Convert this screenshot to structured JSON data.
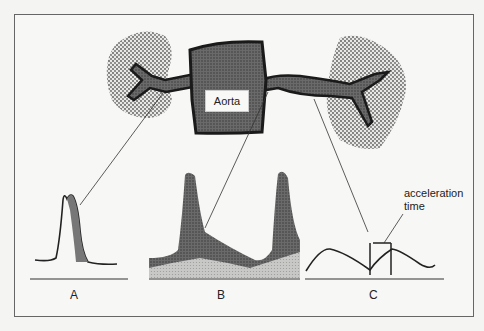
{
  "diagram": {
    "nodes": {
      "aorta": "Aorta",
      "left_kidney": "left kidney",
      "right_kidney": "right kidney"
    },
    "waveforms": [
      {
        "id": "A",
        "label": "A"
      },
      {
        "id": "B",
        "label": "B"
      },
      {
        "id": "C",
        "label": "C"
      }
    ],
    "annotation": {
      "line1": "acceleration",
      "line2": "time"
    }
  }
}
